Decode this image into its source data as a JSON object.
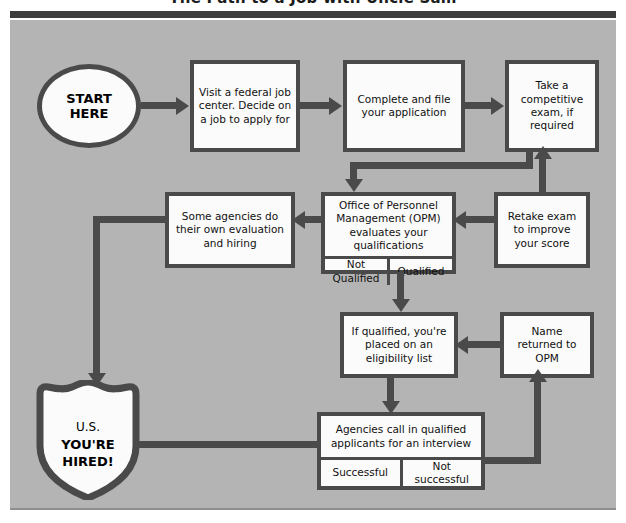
{
  "title": "The Path to a Job with Uncle Sam",
  "palette": {
    "panel_bg": "#b4b4b4",
    "box_fill": "#fbfbfb",
    "ink": "#4a4a4a",
    "rule": "#3d3d3d"
  },
  "nodes": {
    "start": "START\nHERE",
    "start_line1": "START",
    "start_line2": "HERE",
    "visit_center": "Visit a federal job center. Decide on a job to apply for",
    "complete_file": "Complete and file your application",
    "take_exam": "Take a competitive exam, if required",
    "opm_evaluates": "Office of Personnel Management (OPM) evaluates your qualifications",
    "opm_not_qualified": "Not Qualified",
    "opm_qualified": "Qualified",
    "some_agencies": "Some agencies do their own evaluation and hiring",
    "retake_exam": "Retake exam to improve your score",
    "eligibility_list": "If qualified, you're placed on an eligibility list",
    "name_returned": "Name returned to OPM",
    "agencies_call": "Agencies call in qualified applicants for an interview",
    "interview_successful": "Successful",
    "interview_not_successful": "Not successful",
    "hired_small": "U.S.",
    "hired_line1": "YOU'RE",
    "hired_line2": "HIRED!"
  }
}
